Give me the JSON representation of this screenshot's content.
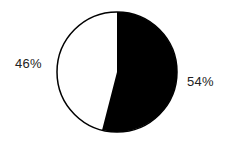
{
  "chart_data": {
    "type": "pie",
    "title": "",
    "start_angle_deg": 90,
    "direction": "clockwise",
    "slices": [
      {
        "label": "54%",
        "value": 54,
        "color": "#000000"
      },
      {
        "label": "46%",
        "value": 46,
        "color": "#ffffff"
      }
    ],
    "legend": null
  },
  "labels": {
    "black_slice": "54%",
    "white_slice": "46%"
  }
}
